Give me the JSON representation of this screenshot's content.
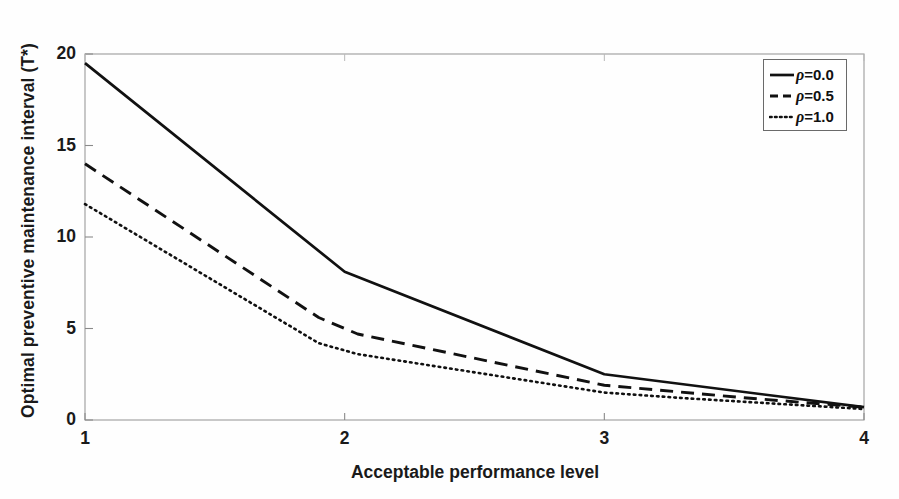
{
  "chart_data": {
    "type": "line",
    "title": "",
    "xlabel": "Acceptable performance level",
    "ylabel": "Optimal preventive maintenance interval (T*)",
    "xlim": [
      1,
      4
    ],
    "ylim": [
      0,
      20
    ],
    "xticks": [
      1,
      2,
      3,
      4
    ],
    "xticklabels": [
      "1",
      "2",
      "3",
      "4"
    ],
    "yticks": [
      0,
      5,
      10,
      15,
      20
    ],
    "yticklabels": [
      "0",
      "5",
      "10",
      "15",
      "20"
    ],
    "grid": false,
    "legend_position": "upper right",
    "x": [
      1,
      2,
      3,
      4
    ],
    "series": [
      {
        "name": "ρ=0.0",
        "rho": "0.0",
        "style": "solid",
        "values": [
          19.5,
          8.1,
          2.5,
          0.7
        ],
        "points": [
          [
            1,
            19.5
          ],
          [
            2,
            8.1
          ],
          [
            3,
            2.5
          ],
          [
            4,
            0.7
          ]
        ]
      },
      {
        "name": "ρ=0.5",
        "rho": "0.5",
        "style": "dashed",
        "values": [
          14.0,
          4.9,
          1.9,
          0.7
        ],
        "points": [
          [
            1,
            14.0
          ],
          [
            1.9,
            5.6
          ],
          [
            2.05,
            4.7
          ],
          [
            3,
            1.9
          ],
          [
            3.55,
            1.2
          ],
          [
            4,
            0.7
          ]
        ]
      },
      {
        "name": "ρ=1.0",
        "rho": "1.0",
        "style": "dotted",
        "values": [
          11.8,
          3.7,
          1.5,
          0.7
        ],
        "points": [
          [
            1,
            11.8
          ],
          [
            1.9,
            4.2
          ],
          [
            2.05,
            3.6
          ],
          [
            3,
            1.5
          ],
          [
            3.3,
            1.2
          ],
          [
            4,
            0.6
          ]
        ]
      }
    ],
    "legend_entries": [
      {
        "label_prefix": "ρ",
        "label_suffix": "=0.0",
        "style": "solid"
      },
      {
        "label_prefix": "ρ",
        "label_suffix": "=0.5",
        "style": "dashed"
      },
      {
        "label_prefix": "ρ",
        "label_suffix": "=1.0",
        "style": "dotted"
      }
    ],
    "colors": {
      "line": "#111111",
      "axis": "#8a8a8a",
      "text": "#1a1a1a",
      "background": "#fefefe"
    }
  }
}
